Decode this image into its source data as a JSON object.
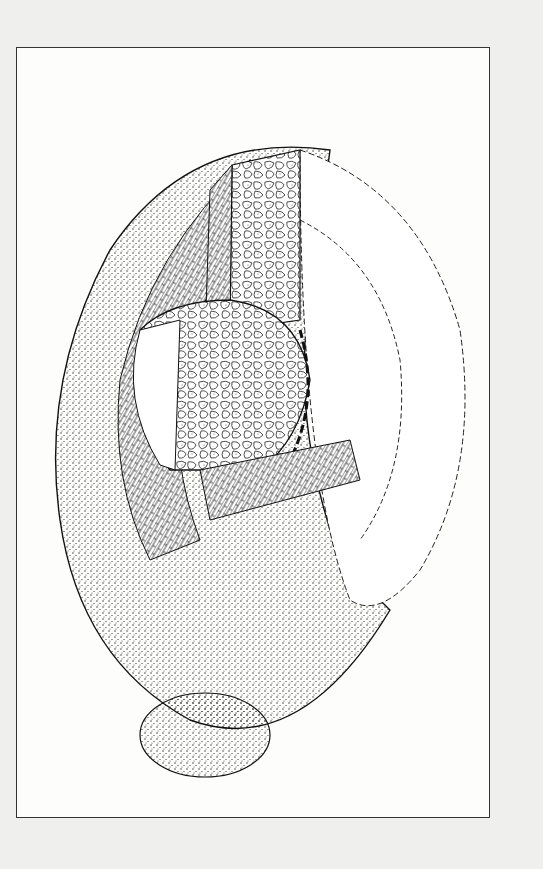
{
  "page": {
    "background": "#efefed",
    "frame_border": "#333333",
    "paper": "#fdfdfc"
  },
  "illustration": {
    "subject": "cutaway-drawing-of-masonry-dome-structure",
    "ink": "#1a1a1a",
    "layers": [
      "outer-stippled-shell",
      "brick-course-band",
      "cobblestone-inner-wall",
      "hollow-interior-arcs",
      "lower-bulb-base"
    ]
  }
}
